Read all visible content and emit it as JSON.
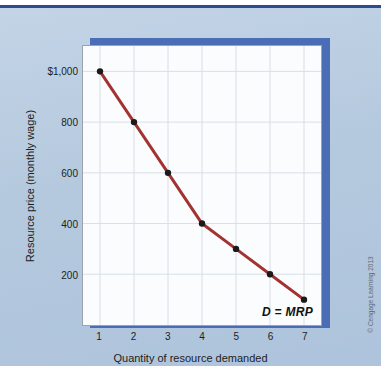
{
  "figure": {
    "background_color": "#b5c9de",
    "rule_color": "#2e4b8f",
    "shadow_color": "#4a6db6",
    "plot_background": "#fbfcfd",
    "copyright": "© Cengage Learning 2013"
  },
  "chart_data": {
    "type": "line",
    "title": "",
    "xlabel": "Quantity of resource demanded",
    "ylabel": "Resource price (monthly wage)",
    "x": [
      1,
      2,
      3,
      4,
      5,
      6,
      7
    ],
    "values": [
      1000,
      800,
      600,
      400,
      300,
      200,
      100
    ],
    "series": [
      {
        "name": "D = MRP",
        "values": [
          1000,
          800,
          600,
          400,
          300,
          200,
          100
        ],
        "line_color": "#a33232",
        "marker_color": "#1a1a1a"
      }
    ],
    "xtick_labels": [
      "1",
      "2",
      "3",
      "4",
      "5",
      "6",
      "7"
    ],
    "ytick_values": [
      200,
      400,
      600,
      800,
      1000
    ],
    "ytick_labels": [
      "200",
      "400",
      "600",
      "800",
      "$1,000"
    ],
    "xlim": [
      0.5,
      7.5
    ],
    "ylim": [
      0,
      1100
    ],
    "grid": true,
    "legend_position": "inline-annotation",
    "annotations": [
      {
        "text": "D = MRP",
        "x": 6.6,
        "y": 60,
        "style": "italic-bold"
      }
    ]
  }
}
